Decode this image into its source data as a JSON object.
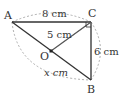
{
  "diagram": {
    "points": {
      "A": {
        "label": "A",
        "x": 12,
        "y": 22
      },
      "C": {
        "label": "C",
        "x": 91,
        "y": 22
      },
      "B": {
        "label": "B",
        "x": 91,
        "y": 80
      },
      "O": {
        "label": "O",
        "x": 51,
        "y": 51
      }
    },
    "lengths": {
      "AC": "8 cm",
      "OC": "5 cm",
      "CB": "6 cm",
      "AB": "x cm"
    },
    "right_angle_at": "C",
    "colors": {
      "solid_line": "#333333",
      "dashed": "#999999",
      "text": "#333333"
    }
  }
}
